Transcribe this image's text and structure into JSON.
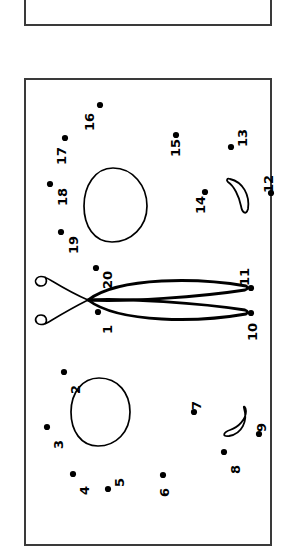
{
  "document": {
    "kind": "dot-to-dot-worksheet",
    "orientation": "rotated-90-ccw",
    "background_color": "#ffffff",
    "ink_color": "#000000",
    "border_color": "#3a3a3a"
  },
  "panels": [
    {
      "name": "upper-panel",
      "x": 24,
      "y": -44,
      "width": 248,
      "height": 70,
      "clipped": true
    },
    {
      "name": "main-panel",
      "x": 24,
      "y": 78,
      "width": 248,
      "height": 468,
      "clipped": true
    }
  ],
  "dots": [
    {
      "label": "1",
      "dot_x": 98,
      "dot_y": 312,
      "text_x": 101,
      "text_y": 334
    },
    {
      "label": "2",
      "dot_x": 64,
      "dot_y": 372,
      "text_x": 69,
      "text_y": 394
    },
    {
      "label": "3",
      "dot_x": 47,
      "dot_y": 427,
      "text_x": 52,
      "text_y": 449
    },
    {
      "label": "4",
      "dot_x": 73,
      "dot_y": 474,
      "text_x": 78,
      "text_y": 495
    },
    {
      "label": "5",
      "dot_x": 108,
      "dot_y": 489,
      "text_x": 113,
      "text_y": 487
    },
    {
      "label": "6",
      "dot_x": 163,
      "dot_y": 475,
      "text_x": 158,
      "text_y": 497
    },
    {
      "label": "7",
      "dot_x": 194,
      "dot_y": 412,
      "text_x": 190,
      "text_y": 410
    },
    {
      "label": "8",
      "dot_x": 224,
      "dot_y": 452,
      "text_x": 229,
      "text_y": 474
    },
    {
      "label": "9",
      "dot_x": 259,
      "dot_y": 434,
      "text_x": 255,
      "text_y": 432
    },
    {
      "label": "10",
      "dot_x": 251,
      "dot_y": 313,
      "text_x": 246,
      "text_y": 341
    },
    {
      "label": "11",
      "dot_x": 251,
      "dot_y": 288,
      "text_x": 238,
      "text_y": 286
    },
    {
      "label": "12",
      "dot_x": 271,
      "dot_y": 193,
      "text_x": 262,
      "text_y": 193
    },
    {
      "label": "13",
      "dot_x": 231,
      "dot_y": 147,
      "text_x": 236,
      "text_y": 147
    },
    {
      "label": "14",
      "dot_x": 205,
      "dot_y": 192,
      "text_x": 194,
      "text_y": 214
    },
    {
      "label": "15",
      "dot_x": 176,
      "dot_y": 135,
      "text_x": 169,
      "text_y": 157
    },
    {
      "label": "16",
      "dot_x": 100,
      "dot_y": 105,
      "text_x": 83,
      "text_y": 131
    },
    {
      "label": "17",
      "dot_x": 65,
      "dot_y": 138,
      "text_x": 55,
      "text_y": 165
    },
    {
      "label": "18",
      "dot_x": 50,
      "dot_y": 184,
      "text_x": 56,
      "text_y": 206
    },
    {
      "label": "19",
      "dot_x": 61,
      "dot_y": 232,
      "text_x": 67,
      "text_y": 254
    },
    {
      "label": "20",
      "dot_x": 96,
      "dot_y": 268,
      "text_x": 101,
      "text_y": 289
    }
  ],
  "shapes": [
    {
      "name": "upper-oval",
      "type": "egg",
      "cx": 115,
      "cy": 205,
      "rx": 30,
      "ry": 35
    },
    {
      "name": "lower-oval",
      "type": "egg",
      "cx": 100,
      "cy": 411,
      "rx": 28,
      "ry": 33
    },
    {
      "name": "upper-crescent",
      "type": "crescent",
      "cx": 238,
      "cy": 197
    },
    {
      "name": "lower-crescent",
      "type": "crescent",
      "cx": 233,
      "cy": 423
    },
    {
      "name": "tendril-leaf",
      "type": "leaf-with-curled-stems",
      "tip_x": 245,
      "tip_y": 300
    }
  ],
  "counts": {
    "total_dots": 20,
    "total_shapes": 5
  }
}
